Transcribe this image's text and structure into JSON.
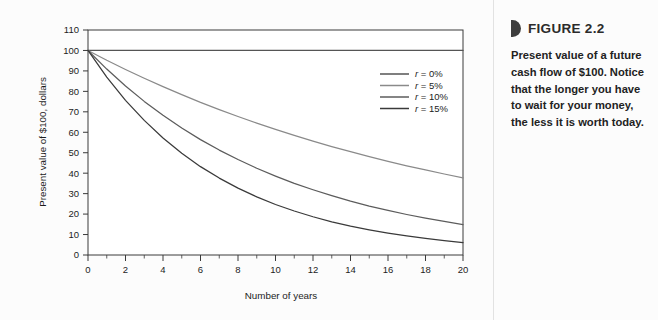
{
  "caption": {
    "figure_label": "FIGURE 2.2",
    "bullet_icon": "right-pointing-half-disc-icon",
    "body": "Present value of a future cash flow of $100. Notice that the longer you have to wait for your money, the less it is worth today."
  },
  "chart_data": {
    "type": "line",
    "title": "",
    "xlabel": "Number of years",
    "ylabel": "Present value of $100, dollars",
    "xlim": [
      0,
      20
    ],
    "ylim": [
      0,
      110
    ],
    "xticks": [
      0,
      2,
      4,
      6,
      8,
      10,
      12,
      14,
      16,
      18,
      20
    ],
    "xtick_labels": [
      "0",
      "2",
      "4",
      "6",
      "8",
      "10",
      "12",
      "14",
      "16",
      "18",
      "20"
    ],
    "xticks_minor": [
      1,
      3,
      5,
      7,
      9,
      11,
      13,
      15,
      17,
      19
    ],
    "yticks": [
      0,
      10,
      20,
      30,
      40,
      50,
      60,
      70,
      80,
      90,
      100,
      110
    ],
    "ytick_labels": [
      "0",
      "10",
      "20",
      "30",
      "40",
      "50",
      "60",
      "70",
      "80",
      "90",
      "100",
      "110"
    ],
    "grid": false,
    "legend_position": "upper-right-inside",
    "x": [
      0,
      1,
      2,
      3,
      4,
      5,
      6,
      7,
      8,
      9,
      10,
      11,
      12,
      13,
      14,
      15,
      16,
      17,
      18,
      19,
      20
    ],
    "series": [
      {
        "name": "r = 0%",
        "rate": 0,
        "color": "#555555",
        "values": [
          100,
          100,
          100,
          100,
          100,
          100,
          100,
          100,
          100,
          100,
          100,
          100,
          100,
          100,
          100,
          100,
          100,
          100,
          100,
          100,
          100
        ]
      },
      {
        "name": "r = 5%",
        "rate": 5,
        "color": "#8a8a8a",
        "values": [
          100,
          95.2,
          90.7,
          86.4,
          82.3,
          78.4,
          74.6,
          71.1,
          67.7,
          64.5,
          61.4,
          58.5,
          55.7,
          53.0,
          50.5,
          48.1,
          45.8,
          43.6,
          41.6,
          39.6,
          37.7
        ]
      },
      {
        "name": "r = 10%",
        "rate": 10,
        "color": "#5c5c5c",
        "values": [
          100,
          90.9,
          82.6,
          75.1,
          68.3,
          62.1,
          56.4,
          51.3,
          46.7,
          42.4,
          38.6,
          35.0,
          31.9,
          29.0,
          26.3,
          23.9,
          21.8,
          19.8,
          18.0,
          16.4,
          14.9
        ]
      },
      {
        "name": "r = 15%",
        "rate": 15,
        "color": "#3a3a3a",
        "values": [
          100,
          87.0,
          75.6,
          65.8,
          57.2,
          49.7,
          43.2,
          37.6,
          32.7,
          28.4,
          24.7,
          21.5,
          18.7,
          16.2,
          14.1,
          12.3,
          10.7,
          9.3,
          8.1,
          7.0,
          6.1
        ]
      }
    ]
  }
}
